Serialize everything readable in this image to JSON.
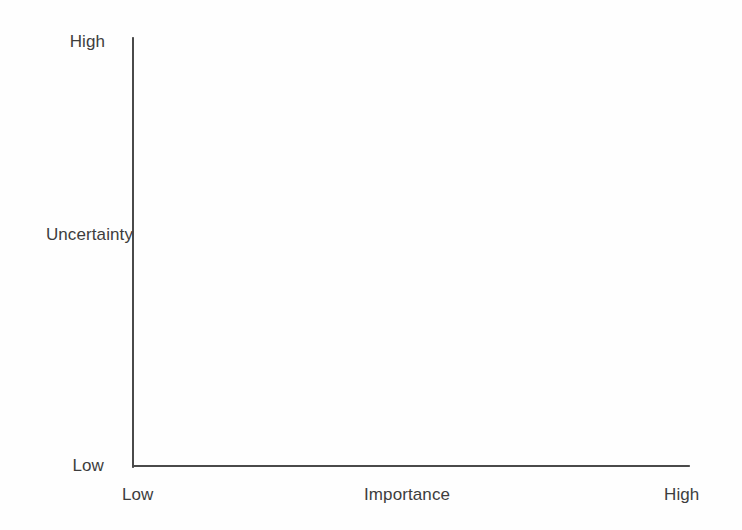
{
  "figure": {
    "background_color": "#fefefe",
    "axis_color": "#4a4a4a",
    "label_color": "#3d3d3d"
  },
  "chart_data": {
    "type": "scatter",
    "title": "",
    "subtitle": "",
    "xlabel": "Importance",
    "ylabel": "Uncertainty",
    "x_tick_labels": [
      "Low",
      "High"
    ],
    "y_tick_labels": [
      "Low",
      "High"
    ],
    "xlim": [
      "Low",
      "High"
    ],
    "ylim": [
      "Low",
      "High"
    ],
    "grid": false,
    "legend": null,
    "legend_position": "none",
    "series": [],
    "points": [],
    "annotations": []
  },
  "axes": {
    "y": {
      "name": "Uncertainty",
      "label": "Uncertainty",
      "high_label": "High",
      "low_label": "Low"
    },
    "x": {
      "name": "Importance",
      "label": "Importance",
      "high_label": "High",
      "low_label": "Low"
    }
  }
}
